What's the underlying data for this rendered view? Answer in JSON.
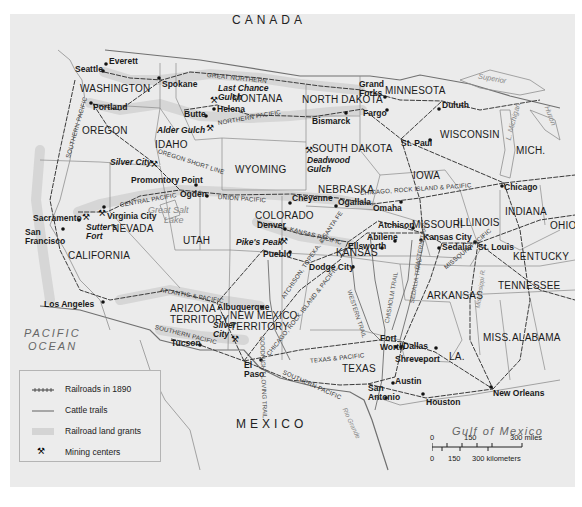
{
  "map": {
    "countries": [
      {
        "id": "canada",
        "label": "CANADA",
        "x": 232,
        "y": 14
      },
      {
        "id": "mexico",
        "label": "MEXICO",
        "x": 236,
        "y": 418
      }
    ],
    "oceans": [
      {
        "id": "pacific",
        "line1": "PACIFIC",
        "line2": "OCEAN",
        "x": 24,
        "y": 328
      },
      {
        "id": "gulf",
        "label": "Gulf of Mexico",
        "x": 452,
        "y": 426
      }
    ],
    "lakes": [
      {
        "id": "great-salt-lake",
        "line1": "Great Salt",
        "line2": "Lake",
        "x": 148,
        "y": 206
      },
      {
        "id": "superior",
        "label": "Superior",
        "x": 478,
        "y": 75
      },
      {
        "id": "michigan",
        "label": "L. Michigan",
        "x": 494,
        "y": 118
      },
      {
        "id": "huron",
        "label": "Huron",
        "x": 540,
        "y": 112
      }
    ],
    "states": [
      {
        "id": "washington",
        "label": "WASHINGTON",
        "x": 80,
        "y": 84
      },
      {
        "id": "oregon",
        "label": "OREGON",
        "x": 82,
        "y": 126
      },
      {
        "id": "idaho",
        "label": "IDAHO",
        "x": 155,
        "y": 140
      },
      {
        "id": "montana",
        "label": "MONTANA",
        "x": 232,
        "y": 94
      },
      {
        "id": "north-dakota",
        "label": "NORTH DAKOTA",
        "x": 302,
        "y": 95
      },
      {
        "id": "minnesota",
        "label": "MINNESOTA",
        "x": 385,
        "y": 86
      },
      {
        "id": "wisconsin",
        "label": "WISCONSIN",
        "x": 440,
        "y": 130
      },
      {
        "id": "mich",
        "label": "MICH.",
        "x": 516,
        "y": 146
      },
      {
        "id": "south-dakota",
        "label": "SOUTH DAKOTA",
        "x": 312,
        "y": 144
      },
      {
        "id": "wyoming",
        "label": "WYOMING",
        "x": 235,
        "y": 165
      },
      {
        "id": "iowa",
        "label": "IOWA",
        "x": 413,
        "y": 171
      },
      {
        "id": "nebraska",
        "label": "NEBRASKA",
        "x": 318,
        "y": 185
      },
      {
        "id": "nevada",
        "label": "NEVADA",
        "x": 112,
        "y": 224
      },
      {
        "id": "utah",
        "label": "UTAH",
        "x": 183,
        "y": 236
      },
      {
        "id": "colorado",
        "label": "COLORADO",
        "x": 255,
        "y": 211
      },
      {
        "id": "indiana",
        "label": "INDIANA",
        "x": 505,
        "y": 207
      },
      {
        "id": "illinois",
        "label": "ILLINOIS",
        "x": 457,
        "y": 218
      },
      {
        "id": "missouri",
        "label": "MISSOURI",
        "x": 412,
        "y": 220
      },
      {
        "id": "ohio",
        "label": "OHIO",
        "x": 550,
        "y": 221
      },
      {
        "id": "kansas",
        "label": "KANSAS",
        "x": 336,
        "y": 248
      },
      {
        "id": "california",
        "label": "CALIFORNIA",
        "x": 68,
        "y": 251
      },
      {
        "id": "kentucky",
        "label": "KENTUCKY",
        "x": 513,
        "y": 252
      },
      {
        "id": "tennessee",
        "label": "TENNESSEE",
        "x": 498,
        "y": 281
      },
      {
        "id": "arkansas",
        "label": "ARKANSAS",
        "x": 427,
        "y": 291
      },
      {
        "id": "arizona",
        "line1": "ARIZONA",
        "line2": "TERRITORY",
        "x": 170,
        "y": 304
      },
      {
        "id": "new-mexico",
        "line1": "NEW MEXICO",
        "line2": "TERRITORY",
        "x": 230,
        "y": 311
      },
      {
        "id": "miss",
        "label": "MISS.",
        "x": 483,
        "y": 333
      },
      {
        "id": "alabama",
        "label": "ALABAMA",
        "x": 512,
        "y": 333
      },
      {
        "id": "texas",
        "label": "TEXAS",
        "x": 342,
        "y": 364
      },
      {
        "id": "la",
        "label": "LA.",
        "x": 449,
        "y": 352
      }
    ],
    "cities": [
      {
        "id": "everett",
        "label": "Everett",
        "x": 109,
        "y": 57,
        "dx": 106,
        "dy": 64
      },
      {
        "id": "seattle",
        "label": "Seattle",
        "x": 75,
        "y": 65,
        "dx": 103,
        "dy": 71
      },
      {
        "id": "spokane",
        "label": "Spokane",
        "x": 162,
        "y": 80,
        "dx": 159,
        "dy": 78
      },
      {
        "id": "portland",
        "label": "Portland",
        "x": 93,
        "y": 103,
        "dx": 91,
        "dy": 103
      },
      {
        "id": "helena",
        "label": "Helena",
        "x": 217,
        "y": 105,
        "dx": 214,
        "dy": 109
      },
      {
        "id": "butte",
        "label": "Butte",
        "x": 184,
        "y": 110,
        "dx": 206,
        "dy": 116
      },
      {
        "id": "grand-forks",
        "line1": "Grand",
        "line2": "Forks",
        "x": 359,
        "y": 80,
        "dx": 385,
        "dy": 97
      },
      {
        "id": "fargo",
        "label": "Fargo",
        "x": 363,
        "y": 109,
        "dx": 387,
        "dy": 110
      },
      {
        "id": "bismarck",
        "label": "Bismarck",
        "x": 312,
        "y": 117,
        "dx": 346,
        "dy": 113
      },
      {
        "id": "duluth",
        "label": "Duluth",
        "x": 442,
        "y": 101,
        "dx": 439,
        "dy": 109
      },
      {
        "id": "st-paul",
        "label": "St. Paul",
        "x": 401,
        "y": 139,
        "dx": 430,
        "dy": 140
      },
      {
        "id": "promontory-point",
        "label": "Promontory Point",
        "x": 131,
        "y": 176,
        "dx": 196,
        "dy": 185
      },
      {
        "id": "ogden",
        "label": "Ogden",
        "x": 180,
        "y": 190,
        "dx": 207,
        "dy": 196
      },
      {
        "id": "cheyenne",
        "label": "Cheyenne",
        "x": 292,
        "y": 194,
        "dx": 290,
        "dy": 203
      },
      {
        "id": "ogallala",
        "label": "Ogallala",
        "x": 338,
        "y": 198,
        "dx": 336,
        "dy": 206
      },
      {
        "id": "omaha",
        "label": "Omaha",
        "x": 373,
        "y": 204,
        "dx": 401,
        "dy": 202
      },
      {
        "id": "chicago",
        "label": "Chicago",
        "x": 504,
        "y": 183,
        "dx": 502,
        "dy": 186
      },
      {
        "id": "sacramento",
        "label": "Sacramento",
        "x": 33,
        "y": 214,
        "dx": 79,
        "dy": 220
      },
      {
        "id": "virginia-city",
        "label": "Virginia City",
        "x": 107,
        "y": 212,
        "dx": 104,
        "dy": 207
      },
      {
        "id": "san-francisco",
        "line1": "San",
        "line2": "Francisco",
        "x": 25,
        "y": 228,
        "dx": 63,
        "dy": 229
      },
      {
        "id": "denver",
        "label": "Denver",
        "x": 257,
        "y": 221,
        "dx": 285,
        "dy": 229
      },
      {
        "id": "atchison",
        "label": "Atchison",
        "x": 378,
        "y": 221,
        "dx": 413,
        "dy": 228
      },
      {
        "id": "pueblo",
        "label": "Pueblo",
        "x": 263,
        "y": 250,
        "dx": 290,
        "dy": 252
      },
      {
        "id": "abilene",
        "label": "Abilene",
        "x": 367,
        "y": 233,
        "dx": 395,
        "dy": 241
      },
      {
        "id": "kansas-city",
        "label": "Kansas City",
        "x": 423,
        "y": 233,
        "dx": 421,
        "dy": 240
      },
      {
        "id": "ellsworth",
        "label": "Ellsworth",
        "x": 348,
        "y": 242,
        "dx": 382,
        "dy": 248
      },
      {
        "id": "sedalia",
        "label": "Sedalia",
        "x": 442,
        "y": 243,
        "dx": 439,
        "dy": 248
      },
      {
        "id": "st-louis",
        "label": "St. Louis",
        "x": 478,
        "y": 243,
        "dx": 475,
        "dy": 242
      },
      {
        "id": "dodge-city",
        "label": "Dodge City",
        "x": 309,
        "y": 263,
        "dx": 353,
        "dy": 267
      },
      {
        "id": "los-angeles",
        "label": "Los Angeles",
        "x": 44,
        "y": 300,
        "dx": 103,
        "dy": 302
      },
      {
        "id": "albuquerque",
        "label": "Albuquerque",
        "x": 217,
        "y": 303,
        "dx": 262,
        "dy": 307
      },
      {
        "id": "tucson",
        "label": "Tucson",
        "x": 171,
        "y": 339,
        "dx": 200,
        "dy": 345
      },
      {
        "id": "el-paso",
        "line1": "El",
        "line2": "Paso",
        "x": 244,
        "y": 361,
        "dx": 261,
        "dy": 360
      },
      {
        "id": "fort-worth",
        "line1": "Fort",
        "line2": "Worth",
        "x": 380,
        "y": 334,
        "dx": 396,
        "dy": 347
      },
      {
        "id": "dallas",
        "label": "Dallas",
        "x": 403,
        "y": 342,
        "dx": 401,
        "dy": 347
      },
      {
        "id": "shreveport",
        "label": "Shreveport",
        "x": 395,
        "y": 355,
        "dx": 436,
        "dy": 348
      },
      {
        "id": "austin",
        "label": "Austin",
        "x": 395,
        "y": 377,
        "dx": 393,
        "dy": 383
      },
      {
        "id": "san-antonio",
        "line1": "San",
        "line2": "Antonio",
        "x": 368,
        "y": 384,
        "dx": 386,
        "dy": 398
      },
      {
        "id": "houston",
        "label": "Houston",
        "x": 426,
        "y": 398,
        "dx": 423,
        "dy": 394
      },
      {
        "id": "new-orleans",
        "label": "New Orleans",
        "x": 493,
        "y": 389,
        "dx": 491,
        "dy": 387
      }
    ],
    "mining_centers": [
      {
        "id": "last-chance-gulch",
        "line1": "Last Chance",
        "line2": "Gulch",
        "x": 218,
        "y": 84,
        "ix": 210,
        "iy": 96
      },
      {
        "id": "alder-gulch",
        "label": "Alder Gulch",
        "x": 157,
        "y": 126,
        "ix": 206,
        "iy": 124
      },
      {
        "id": "deadwood-gulch",
        "line1": "Deadwood",
        "line2": "Gulch",
        "x": 307,
        "y": 156,
        "ix": 305,
        "iy": 146
      },
      {
        "id": "silver-city-id",
        "label": "Silver City",
        "x": 110,
        "y": 158,
        "ix": 150,
        "iy": 160
      },
      {
        "id": "virginia-city",
        "label": "",
        "x": 0,
        "y": 0,
        "ix": 98,
        "iy": 209
      },
      {
        "id": "sutters-fort",
        "line1": "Sutter's",
        "line2": "Fort",
        "x": 86,
        "y": 223,
        "ix": 82,
        "iy": 213
      },
      {
        "id": "pikes-peak",
        "label": "Pike's Peak",
        "x": 236,
        "y": 238,
        "ix": 280,
        "iy": 237
      },
      {
        "id": "silver-city-nm",
        "line1": "Silver",
        "line2": "City",
        "x": 213,
        "y": 321,
        "ix": 231,
        "iy": 335
      }
    ],
    "railroads": [
      {
        "id": "great-northern",
        "label": "GREAT NORTHERN",
        "x": 207,
        "y": 72,
        "rot": 6
      },
      {
        "id": "northern-pacific",
        "label": "NORTHERN PACIFIC",
        "x": 218,
        "y": 120,
        "rot": -10
      },
      {
        "id": "southern-pacific-n",
        "label": "SOUTHERN PACIFIC",
        "x": 68,
        "y": 155,
        "rot": -74
      },
      {
        "id": "oregon-short-line",
        "label": "OREGON SHORT LINE",
        "x": 158,
        "y": 148,
        "rot": 18
      },
      {
        "id": "central-pacific",
        "label": "CENTRAL PACIFIC",
        "x": 120,
        "y": 202,
        "rot": -10
      },
      {
        "id": "union-pacific",
        "label": "UNION PACIFIC",
        "x": 218,
        "y": 194,
        "rot": 4
      },
      {
        "id": "kansas-pacific",
        "label": "KANSAS PACIFIC",
        "x": 290,
        "y": 226,
        "rot": 15
      },
      {
        "id": "atchison-topeka",
        "label": "ATCHISON, TOPEKA, & SANTA FE",
        "x": 283,
        "y": 295,
        "rot": -56
      },
      {
        "id": "chicago-rock-island",
        "label": "CHICAGO, ROCK ISLAND & PACIFIC",
        "x": 360,
        "y": 190,
        "rot": -4
      },
      {
        "id": "atlantic-pacific",
        "label": "ATLANTIC & PACIFIC",
        "x": 160,
        "y": 287,
        "rot": 10
      },
      {
        "id": "southern-pacific-s",
        "label": "SOUTHERN PACIFIC",
        "x": 155,
        "y": 324,
        "rot": 14
      },
      {
        "id": "chicago-rock-island-s",
        "label": "CHICAGO, ROCK ISLAND & PACIFIC",
        "x": 268,
        "y": 352,
        "rot": -52
      },
      {
        "id": "texas-pacific",
        "label": "TEXAS & PACIFIC",
        "x": 310,
        "y": 358,
        "rot": -6
      },
      {
        "id": "southern-pacific-tx",
        "label": "SOUTHERN PACIFIC",
        "x": 283,
        "y": 369,
        "rot": 24
      },
      {
        "id": "missouri-pacific",
        "label": "MISSOURI PACIFIC",
        "x": 445,
        "y": 265,
        "rot": -40
      }
    ],
    "cattle_trails": [
      {
        "id": "western-trail",
        "label": "WESTERN TRAIL",
        "x": 349,
        "y": 287,
        "rot": 72
      },
      {
        "id": "chisholm-trail",
        "label": "CHISHOLM TRAIL",
        "x": 387,
        "y": 320,
        "rot": -80
      },
      {
        "id": "sedalia-trail",
        "label": "SEDALIA TRAIL",
        "x": 412,
        "y": 300,
        "rot": -80
      },
      {
        "id": "eastern-trail",
        "label": "EASTERN TRAIL",
        "x": 417,
        "y": 266,
        "rot": -80
      },
      {
        "id": "goodnight-loving",
        "label": "GOODNIGHT-LOVING TRAIL",
        "x": 262,
        "y": 333,
        "rot": 88
      }
    ],
    "rivers": [
      {
        "id": "rio-grande",
        "label": "Rio Grande",
        "x": 344,
        "y": 405,
        "rot": 65
      },
      {
        "id": "mississippi",
        "label": "Mississippi R.",
        "x": 478,
        "y": 305,
        "rot": -82
      }
    ]
  },
  "legend": {
    "items": [
      {
        "id": "railroads",
        "label": "Railroads in 1890"
      },
      {
        "id": "cattle-trails",
        "label": "Cattle trails"
      },
      {
        "id": "land-grants",
        "label": "Railroad land grants"
      },
      {
        "id": "mining",
        "label": "Mining centers",
        "icon": "⚒"
      }
    ]
  },
  "scale": {
    "miles_labels": [
      "0",
      "150",
      "300 miles"
    ],
    "km_labels": [
      "0",
      "150",
      "300 kilometers"
    ]
  },
  "colors": {
    "background": "#ebebeb",
    "land_grant": "#d2d2d2",
    "railroad": "#3a3a3a",
    "trail": "#7a7a7a",
    "border": "#7d7d7d",
    "water_line": "#9a9a9a"
  }
}
